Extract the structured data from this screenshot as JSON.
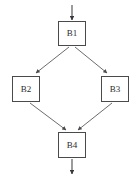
{
  "diagram": {
    "type": "flowchart",
    "title": "",
    "colors": {
      "edge": "#5a5a5a",
      "node_border": "#4a4a4a",
      "node_fill": "#ffffff",
      "label_text": "#2b2b2b",
      "background": "#ffffff",
      "caption_text": "#d8d8d8"
    },
    "nodes": [
      {
        "id": "B1",
        "label": "B1",
        "x": 58,
        "y": 21,
        "width": 28,
        "height": 25
      },
      {
        "id": "B2",
        "label": "B2",
        "x": 12,
        "y": 76,
        "width": 28,
        "height": 26
      },
      {
        "id": "B3",
        "label": "B3",
        "x": 101,
        "y": 76,
        "width": 28,
        "height": 26
      },
      {
        "id": "B4",
        "label": "B4",
        "x": 58,
        "y": 132,
        "width": 28,
        "height": 26
      }
    ],
    "edges": [
      {
        "id": "entry",
        "from": "",
        "to": "B1",
        "label": "",
        "arrowhead": "solid"
      },
      {
        "id": "b1-b2",
        "from": "B1",
        "to": "B2",
        "label": "",
        "arrowhead": "open"
      },
      {
        "id": "b1-b3",
        "from": "B1",
        "to": "B3",
        "label": "",
        "arrowhead": "open"
      },
      {
        "id": "b2-b4",
        "from": "B2",
        "to": "B4",
        "label": "",
        "arrowhead": "open"
      },
      {
        "id": "b3-b4",
        "from": "B3",
        "to": "B4",
        "label": "",
        "arrowhead": "open"
      },
      {
        "id": "exit",
        "from": "B4",
        "to": "",
        "label": "",
        "arrowhead": "solid"
      }
    ],
    "caption": {
      "line": ""
    }
  }
}
